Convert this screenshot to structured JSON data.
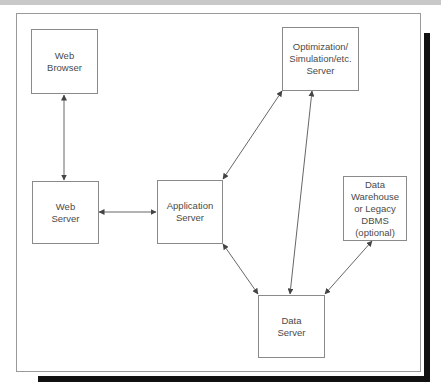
{
  "diagram": {
    "nodes": {
      "web_browser": "Web\nBrowser",
      "web_server": "Web\nServer",
      "application_server": "Application\nServer",
      "optimization_server": "Optimization/\nSimulation/etc.\nServer",
      "data_warehouse": "Data\nWarehouse\nor Legacy\nDBMS\n(optional)",
      "data_server": "Data\nServer"
    },
    "edges": [
      {
        "from": "Web Browser",
        "to": "Web Server",
        "type": "bidirectional"
      },
      {
        "from": "Web Server",
        "to": "Application Server",
        "type": "bidirectional"
      },
      {
        "from": "Application Server",
        "to": "Optimization/Simulation/etc. Server",
        "type": "bidirectional"
      },
      {
        "from": "Application Server",
        "to": "Data Server",
        "type": "bidirectional"
      },
      {
        "from": "Optimization/Simulation/etc. Server",
        "to": "Data Server",
        "type": "bidirectional"
      },
      {
        "from": "Data Warehouse or Legacy DBMS (optional)",
        "to": "Data Server",
        "type": "bidirectional"
      }
    ],
    "colors": {
      "border": "#8a8a8a",
      "text": "#4a4a4a",
      "arrow": "#555555",
      "shadow": "#111111",
      "top_band": "#c8c8c8"
    }
  }
}
